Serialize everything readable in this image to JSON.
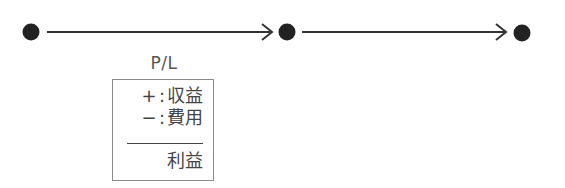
{
  "diagram": {
    "nodes": [
      {
        "id": "node-1",
        "cx": 31,
        "cy": 32,
        "r": 8.5
      },
      {
        "id": "node-2",
        "cx": 287,
        "cy": 32,
        "r": 8.5
      },
      {
        "id": "node-3",
        "cx": 522,
        "cy": 33,
        "r": 8.5
      }
    ],
    "arrows": [
      {
        "from": "node-1",
        "to": "node-2"
      },
      {
        "from": "node-2",
        "to": "node-3"
      }
    ],
    "colors": {
      "node": "#222222",
      "arrow": "#333333",
      "box_border": "#8a8a8a",
      "text": "#444444"
    }
  },
  "pl": {
    "title": "P/L",
    "rows": [
      {
        "sign": "+",
        "colon": ":",
        "label": "収益"
      },
      {
        "sign": "−",
        "colon": ":",
        "label": "費用"
      }
    ],
    "result_label": "利益"
  }
}
